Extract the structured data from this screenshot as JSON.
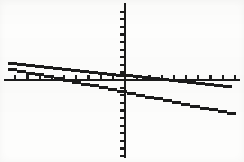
{
  "screen": {
    "kind": "graphing-calculator-plot",
    "background_color": "#fdfdfc",
    "ink_color": "#1b1b1b",
    "width_px": 244,
    "height_px": 162
  },
  "chart_data": {
    "type": "line",
    "title": "",
    "subtitle": "",
    "xlabel": "",
    "ylabel": "",
    "grid": false,
    "legend": "none",
    "axis_style": "calculator-screen-with-tick-marks",
    "origin_px": {
      "x": 124,
      "y": 79
    },
    "xlim": [
      -10,
      10
    ],
    "ylim": [
      -10,
      10
    ],
    "x_axis": {
      "visible": true,
      "from_px": 4,
      "to_px": 240,
      "tick_count_left": 9,
      "tick_count_right": 9,
      "tick_spacing_px": 12.2,
      "tick_length_px": 4,
      "tick_labels": []
    },
    "y_axis": {
      "visible": true,
      "from_px": 3,
      "to_px": 158,
      "tick_count_above": 10,
      "tick_count_below": 10,
      "tick_spacing_px": 7.6,
      "tick_length_px": 4,
      "tick_labels": []
    },
    "series": [
      {
        "name": "line-1",
        "description": "shallow descending line",
        "slope": -0.1,
        "intercept": -0.15,
        "points_px": [
          {
            "x": 8,
            "y": 62
          },
          {
            "x": 232,
            "y": 85
          }
        ],
        "x_intercept": -1.4,
        "y_intercept": -0.15,
        "style": "solid"
      },
      {
        "name": "line-2",
        "description": "steeper descending line",
        "slope": -0.3,
        "intercept": -0.62,
        "points_px": [
          {
            "x": 8,
            "y": 67
          },
          {
            "x": 236,
            "y": 113
          }
        ],
        "x_intercept": -2.1,
        "y_intercept": -0.62,
        "style": "solid"
      }
    ],
    "annotations": []
  }
}
